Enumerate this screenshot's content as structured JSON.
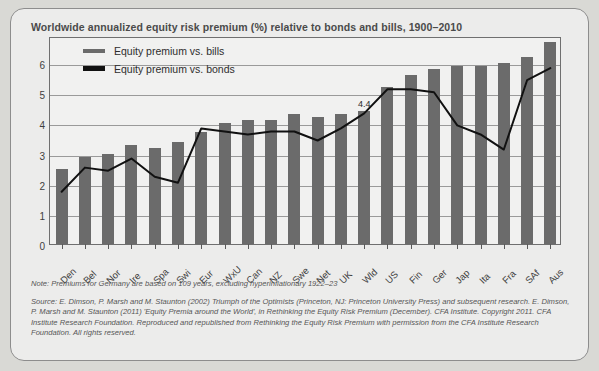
{
  "title": "Worldwide annualized equity risk premium (%) relative to bonds and bills, 1900–2010",
  "legend": {
    "items": [
      {
        "label": "Equity premium vs. bills",
        "color": "#6b6b6b",
        "type": "bar"
      },
      {
        "label": "Equity premium vs. bonds",
        "color": "#111111",
        "type": "line"
      }
    ]
  },
  "annotations": [
    {
      "text": "4.4",
      "category": "Wld",
      "value": 4.4
    }
  ],
  "notes": {
    "note": "Note: Premiums for Germany are based on 109 years, excluding hyperinflationary 1922–23",
    "source": "Source: E. Dimson, P. Marsh and M. Staunton (2002) Triumph of the Optimists (Princeton, NJ: Princeton University Press) and subsequent research. E. Dimson, P. Marsh and M. Staunton (2011) 'Equity Premia around the World', in Rethinking the Equity Risk Premium (December). CFA Institute. Copyright 2011. CFA Institute Research Foundation. Reproduced and republished from Rethinking the Equity Risk Premium with permission from the CFA Institute Research Foundation. All rights reserved."
  },
  "chart_data": {
    "type": "bar",
    "title": "Worldwide annualized equity risk premium (%) relative to bonds and bills, 1900–2010",
    "xlabel": "",
    "ylabel": "",
    "ylim": [
      0,
      6.9
    ],
    "yticks": [
      0,
      1,
      2,
      3,
      4,
      5,
      6
    ],
    "grid": true,
    "legend_position": "top-left",
    "categories": [
      "Den",
      "Bel",
      "Nor",
      "Ire",
      "Spa",
      "Swi",
      "Eur",
      "WxU",
      "Can",
      "NZ",
      "Swe",
      "Net",
      "UK",
      "Wld",
      "US",
      "Fin",
      "Ger",
      "Jap",
      "Ita",
      "Fra",
      "SAf",
      "Aus"
    ],
    "series": [
      {
        "name": "Equity premium vs. bills",
        "type": "bar",
        "color": "#6b6b6b",
        "values": [
          2.5,
          2.9,
          3.0,
          3.3,
          3.2,
          3.4,
          3.7,
          4.0,
          4.1,
          4.1,
          4.3,
          4.2,
          4.3,
          4.4,
          5.2,
          5.6,
          5.8,
          5.9,
          5.9,
          6.0,
          6.2,
          6.7
        ]
      },
      {
        "name": "Equity premium vs. bonds",
        "type": "line",
        "color": "#111111",
        "values": [
          1.8,
          2.6,
          2.5,
          2.9,
          2.3,
          2.1,
          3.9,
          3.8,
          3.7,
          3.8,
          3.8,
          3.5,
          3.9,
          4.4,
          5.2,
          5.2,
          5.1,
          4.0,
          3.7,
          3.2,
          5.5,
          5.9
        ]
      }
    ]
  }
}
